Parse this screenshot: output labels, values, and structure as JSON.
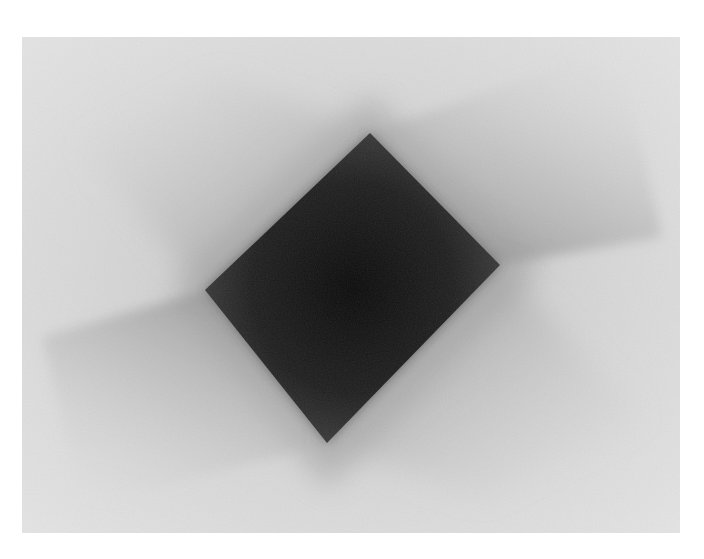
{
  "image": {
    "description": "Abstract grayscale photograph of a dark rotated square casting soft pinwheel-like shadows on a light textured surface",
    "alt_text": "Dark square with soft gray shadows on light background",
    "colors": {
      "page_background": "#ffffff",
      "surface_light": "#e2e2e2",
      "surface_mid": "#cfcfcf",
      "shadow_soft": "#a8a8a8",
      "shadow_mid": "#7a7a7a",
      "square_edge": "#3a3a3a",
      "square_core": "#0c0c0c"
    },
    "geometry": {
      "photo_box": {
        "x": 22,
        "y": 37,
        "width": 658,
        "height": 496
      },
      "square_vertices": [
        [
          370,
          133
        ],
        [
          500,
          265
        ],
        [
          327,
          443
        ],
        [
          205,
          290
        ]
      ]
    }
  }
}
